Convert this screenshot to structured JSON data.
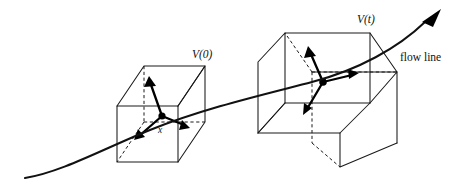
{
  "figure": {
    "name": "flow-line-volume-transport-diagram",
    "background_color": "#ffffff",
    "ink_color": "#111111",
    "width": 470,
    "height": 184
  },
  "labels": {
    "volume_initial": "V(0)",
    "volume_time_t": "V(t)",
    "flow_line": "flow line",
    "point_x": "x"
  },
  "elements": {
    "cube_initial_name": "cube-V0",
    "cube_final_name": "cube-Vt",
    "curve_name": "flow-line-curve",
    "vectors_initial": [
      "up-vector",
      "right-vector",
      "down-left-vector"
    ],
    "vectors_final": [
      "up-vector",
      "right-vector",
      "down-left-vector"
    ]
  },
  "geometry": {
    "cube_initial": {
      "front_face": [
        [
          117,
          106
        ],
        [
          178,
          106
        ],
        [
          178,
          162
        ],
        [
          117,
          162
        ]
      ],
      "depth_offset": [
        27,
        -40
      ],
      "center_point": [
        162,
        116
      ]
    },
    "cube_final": {
      "front_face": [
        [
          285,
          62
        ],
        [
          370,
          62
        ],
        [
          370,
          135
        ],
        [
          285,
          135
        ]
      ],
      "depth_offset": [
        -27,
        -32
      ],
      "center_point": [
        323,
        82
      ]
    },
    "flow_curve_path": "M 25 178 C 70 170, 120 140, 175 118 C 240 92, 300 82, 355 62 C 400 46, 425 28, 441 10",
    "arrow_tip": [
      441,
      10
    ]
  }
}
